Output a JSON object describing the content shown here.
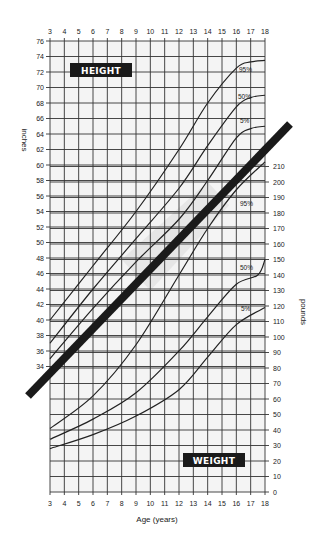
{
  "chart_data": {
    "type": "line",
    "title": "",
    "xlabel": "Age (years)",
    "x_ticks": [
      3,
      4,
      5,
      6,
      7,
      8,
      9,
      10,
      11,
      12,
      13,
      14,
      15,
      16,
      17,
      18
    ],
    "left_axis": {
      "label": "inches",
      "ticks": [
        34,
        36,
        38,
        40,
        42,
        44,
        46,
        48,
        50,
        52,
        54,
        56,
        58,
        60,
        62,
        64,
        66,
        68,
        70,
        72,
        74,
        76
      ],
      "range": [
        34,
        76
      ]
    },
    "right_axis": {
      "label": "pounds",
      "ticks": [
        0,
        10,
        20,
        30,
        40,
        50,
        60,
        70,
        80,
        90,
        100,
        110,
        120,
        130,
        140,
        150,
        160,
        170,
        180,
        190,
        200,
        210
      ],
      "range": [
        0,
        210
      ]
    },
    "panels": {
      "height_label": "HEIGHT",
      "weight_label": "WEIGHT"
    },
    "height_series": [
      {
        "name": "95%",
        "x": [
          3,
          6,
          9,
          12,
          14,
          16,
          17,
          18
        ],
        "values": [
          40,
          47,
          54,
          62,
          68,
          72.5,
          73.3,
          73.5
        ]
      },
      {
        "name": "50%",
        "x": [
          3,
          6,
          9,
          12,
          14,
          16,
          17,
          18
        ],
        "values": [
          37,
          44,
          50.5,
          57,
          62.5,
          67.5,
          68.7,
          69
        ]
      },
      {
        "name": "5%",
        "x": [
          3,
          6,
          9,
          12,
          14,
          16,
          17,
          18
        ],
        "values": [
          35,
          41.5,
          47.5,
          53,
          58,
          63.5,
          64.7,
          65
        ]
      }
    ],
    "weight_series": [
      {
        "name": "95%",
        "x": [
          3,
          6,
          9,
          12,
          14,
          16,
          18
        ],
        "values": [
          41,
          62,
          95,
          140,
          170,
          195,
          213
        ]
      },
      {
        "name": "50%",
        "x": [
          3,
          6,
          9,
          12,
          14,
          16,
          17.5,
          18
        ],
        "values": [
          34,
          47,
          64,
          91,
          113,
          134,
          140,
          150
        ]
      },
      {
        "name": "5%",
        "x": [
          3,
          6,
          9,
          12,
          14,
          16,
          18
        ],
        "values": [
          28,
          37,
          49,
          66,
          87,
          108,
          119
        ]
      }
    ],
    "divider_line": {
      "description": "thick diagonal band separating height and weight panels"
    },
    "grid": true,
    "legend": "inline percentile labels near curve ends"
  }
}
